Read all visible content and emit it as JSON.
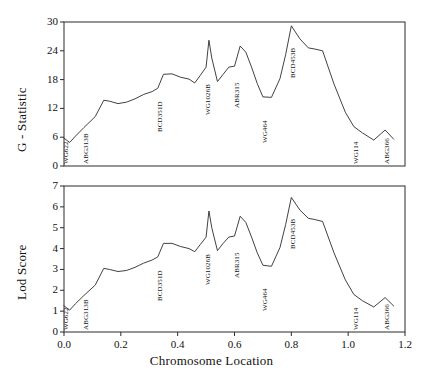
{
  "figure": {
    "xlabel": "Chromosome Location",
    "background": "#ffffff",
    "line_color": "#2b2b2b"
  },
  "panels": {
    "top": {
      "ylabel": "G - Statistic"
    },
    "bottom": {
      "ylabel": "Lod Score"
    }
  },
  "markers": [
    {
      "name": "WG622",
      "x": 0.0
    },
    {
      "name": "ABG313B",
      "x": 0.07
    },
    {
      "name": "BCD351D",
      "x": 0.33
    },
    {
      "name": "WG1026B",
      "x": 0.5
    },
    {
      "name": "ABR315",
      "x": 0.6
    },
    {
      "name": "WG464",
      "x": 0.7
    },
    {
      "name": "BCD453B",
      "x": 0.8
    },
    {
      "name": "WG114",
      "x": 1.02
    },
    {
      "name": "ABG366",
      "x": 1.13
    }
  ],
  "chart_data": [
    {
      "type": "line",
      "title": "",
      "xlabel": "Chromosome Location",
      "ylabel": "G - Statistic",
      "xlim": [
        0.0,
        1.2
      ],
      "ylim": [
        0,
        30
      ],
      "xticks": [
        "0.0",
        "0.2",
        "0.4",
        "0.6",
        "0.8",
        "1.0",
        "1.2"
      ],
      "xtick_values": [
        0.0,
        0.2,
        0.4,
        0.6,
        0.8,
        1.0,
        1.2
      ],
      "yticks": [
        "0",
        "6",
        "12",
        "18",
        "24",
        "30"
      ],
      "ytick_values": [
        0,
        6,
        12,
        18,
        24,
        30
      ],
      "grid": false,
      "legend": "none",
      "series": [
        {
          "name": "G - Statistic",
          "x": [
            0.0,
            0.02,
            0.04,
            0.07,
            0.11,
            0.14,
            0.16,
            0.19,
            0.22,
            0.25,
            0.28,
            0.31,
            0.33,
            0.35,
            0.38,
            0.41,
            0.44,
            0.46,
            0.48,
            0.5,
            0.51,
            0.52,
            0.54,
            0.56,
            0.58,
            0.6,
            0.62,
            0.64,
            0.66,
            0.68,
            0.7,
            0.73,
            0.76,
            0.78,
            0.8,
            0.83,
            0.86,
            0.88,
            0.91,
            0.95,
            0.99,
            1.02,
            1.05,
            1.09,
            1.13,
            1.16
          ],
          "values": [
            5.8,
            4.9,
            6.2,
            8.0,
            10.3,
            13.7,
            13.5,
            13.0,
            13.3,
            14.0,
            14.9,
            15.5,
            16.2,
            19.1,
            19.2,
            18.5,
            18.1,
            17.3,
            18.9,
            20.6,
            26.2,
            22.5,
            17.6,
            19.1,
            20.6,
            20.8,
            25.0,
            23.7,
            20.6,
            17.2,
            14.4,
            14.3,
            18.2,
            23.2,
            29.2,
            26.5,
            24.6,
            24.4,
            24.0,
            17.1,
            11.2,
            8.2,
            6.9,
            5.4,
            7.5,
            5.6
          ]
        }
      ]
    },
    {
      "type": "line",
      "title": "",
      "xlabel": "Chromosome Location",
      "ylabel": "Lod Score",
      "xlim": [
        0.0,
        1.2
      ],
      "ylim": [
        0,
        7
      ],
      "xticks": [
        "0.0",
        "0.2",
        "0.4",
        "0.6",
        "0.8",
        "1.0",
        "1.2"
      ],
      "xtick_values": [
        0.0,
        0.2,
        0.4,
        0.6,
        0.8,
        1.0,
        1.2
      ],
      "yticks": [
        "0",
        "1",
        "2",
        "3",
        "4",
        "5",
        "6",
        "7"
      ],
      "ytick_values": [
        0,
        1,
        2,
        3,
        4,
        5,
        6,
        7
      ],
      "grid": false,
      "legend": "none",
      "series": [
        {
          "name": "Lod Score",
          "x": [
            0.0,
            0.02,
            0.04,
            0.07,
            0.11,
            0.14,
            0.16,
            0.19,
            0.22,
            0.25,
            0.28,
            0.31,
            0.33,
            0.35,
            0.38,
            0.41,
            0.44,
            0.46,
            0.48,
            0.5,
            0.51,
            0.52,
            0.54,
            0.56,
            0.58,
            0.6,
            0.62,
            0.64,
            0.66,
            0.68,
            0.7,
            0.73,
            0.76,
            0.78,
            0.8,
            0.83,
            0.86,
            0.88,
            0.91,
            0.95,
            0.99,
            1.02,
            1.05,
            1.09,
            1.13,
            1.16
          ],
          "values": [
            1.25,
            1.05,
            1.35,
            1.75,
            2.25,
            3.05,
            3.0,
            2.9,
            2.95,
            3.1,
            3.3,
            3.45,
            3.6,
            4.25,
            4.25,
            4.1,
            4.0,
            3.85,
            4.2,
            4.55,
            5.8,
            5.0,
            3.9,
            4.25,
            4.55,
            4.6,
            5.55,
            5.25,
            4.55,
            3.8,
            3.2,
            3.15,
            4.05,
            5.15,
            6.45,
            5.85,
            5.45,
            5.4,
            5.3,
            3.8,
            2.5,
            1.8,
            1.5,
            1.2,
            1.65,
            1.25
          ]
        }
      ]
    }
  ]
}
